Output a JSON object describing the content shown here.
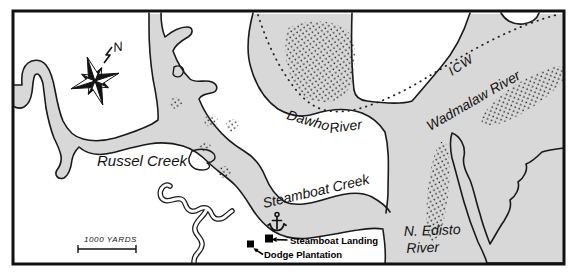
{
  "map": {
    "region_labels": {
      "russel_creek": "Russel Creek",
      "steamboat_creek": "Steamboat Creek",
      "dawho_word1": "Dawho",
      "dawho_word2": "River",
      "icw": "ICW",
      "wadmalaw_river": "Wadmalaw River",
      "n_edisto_line1": "N. Edisto",
      "n_edisto_line2": "River"
    },
    "poi_labels": {
      "steamboat_landing": "Steamboat Landing",
      "dodge_plantation": "Dodge Plantation"
    },
    "compass": {
      "north_label": "N"
    },
    "scale_bar": {
      "label": "1000 YARDS"
    },
    "colors": {
      "water": "#d8d8d8",
      "land": "#ffffff",
      "outline": "#1a1a1a"
    }
  }
}
